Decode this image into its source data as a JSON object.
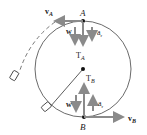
{
  "diagram": {
    "point_top": "A",
    "point_bottom": "B",
    "labels": {
      "vA": "v",
      "vA_sub": "A",
      "vB": "v",
      "vB_sub": "B",
      "w_top": "w",
      "w_bottom": "w",
      "ar_top": "a",
      "ar_top_sub": "r",
      "ar_bottom": "a",
      "ar_bottom_sub": "r",
      "TA": "T",
      "TA_sub": "A",
      "TB": "T",
      "TB_sub": "B"
    },
    "colors": {
      "arrow": "#8a8a8a",
      "line": "#333333",
      "point": "#111111"
    }
  }
}
